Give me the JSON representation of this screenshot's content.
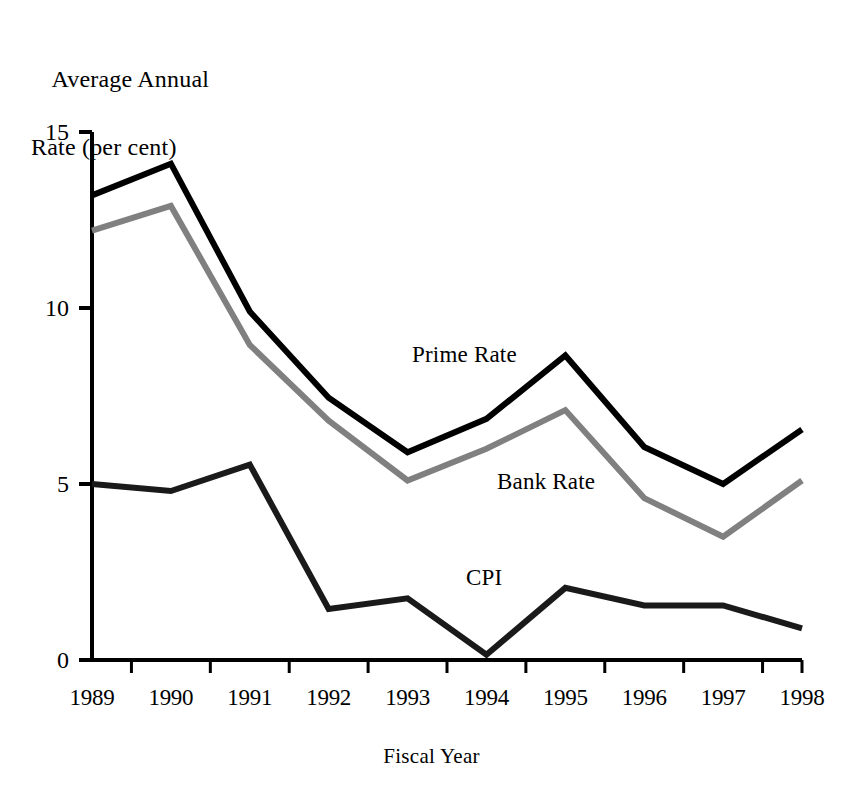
{
  "chart_data": {
    "type": "line",
    "title": "",
    "xlabel": "Fiscal Year",
    "ylabel": "Average Annual Rate (per cent)",
    "ylabel_line1": "Average Annual",
    "ylabel_line2": "Rate (per cent)",
    "categories": [
      "1989",
      "1990",
      "1991",
      "1992",
      "1993",
      "1994",
      "1995",
      "1996",
      "1997",
      "1998"
    ],
    "x": [
      1989,
      1990,
      1991,
      1992,
      1993,
      1994,
      1995,
      1996,
      1997,
      1998
    ],
    "ylim": [
      0,
      15
    ],
    "yticks": [
      0,
      5,
      10,
      15
    ],
    "ytick_labels": [
      "0",
      "5",
      "10",
      "15"
    ],
    "grid": false,
    "legend_position": "inline-annotations",
    "series": [
      {
        "name": "Prime Rate",
        "color": "#000000",
        "width": 6,
        "values": [
          13.2,
          14.1,
          9.9,
          7.45,
          5.9,
          6.85,
          8.65,
          6.05,
          5.0,
          6.55
        ]
      },
      {
        "name": "Bank Rate",
        "color": "#808080",
        "width": 6,
        "values": [
          12.2,
          12.9,
          8.95,
          6.8,
          5.1,
          6.0,
          7.1,
          4.6,
          3.5,
          5.1
        ]
      },
      {
        "name": "CPI",
        "color": "#1a1a1a",
        "width": 6,
        "values": [
          5.0,
          4.8,
          5.55,
          1.45,
          1.75,
          0.15,
          2.05,
          1.55,
          1.55,
          0.9
        ]
      }
    ],
    "annotations": [
      {
        "text": "Prime Rate",
        "x_px": 412,
        "y_px": 343
      },
      {
        "text": "Bank Rate",
        "x_px": 497,
        "y_px": 470
      },
      {
        "text": "CPI",
        "x_px": 466,
        "y_px": 566
      }
    ],
    "axis_colors": {
      "axis_line": "#000000",
      "background": "#ffffff"
    }
  },
  "geometry": {
    "plot_left": 92,
    "plot_right": 802,
    "plot_top": 132,
    "plot_bottom": 660
  }
}
